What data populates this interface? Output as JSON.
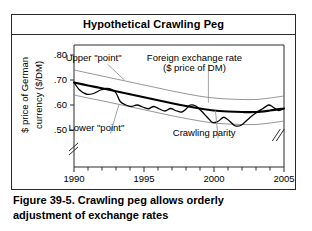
{
  "panel": {
    "title": "Hypothetical Crawling Peg"
  },
  "caption": {
    "line1": "Figure 39-5.  Crawling peg allows orderly",
    "line2": "adjustment of exchange rates"
  },
  "colors": {
    "frame": "#2a2a2a",
    "band": "#8a8a8a",
    "parity": "#000000",
    "rate": "#000000",
    "leader": "#8a8a8a"
  },
  "chart_data": {
    "type": "line",
    "title": "Hypothetical Crawling Peg",
    "xlabel": "Year",
    "ylabel": "$ price of German currency ($/DM)",
    "ylabel_line1": "$ price of German",
    "ylabel_line2": "currency ($/DM)",
    "xlim": [
      1990,
      2005
    ],
    "ylim": [
      0.44,
      0.84
    ],
    "grid": false,
    "axis_break_y": true,
    "axis_break_x": true,
    "xticks": [
      1990,
      1991,
      1992,
      1993,
      1994,
      1995,
      1996,
      1997,
      1998,
      1999,
      2000,
      2001,
      2002,
      2003,
      2004,
      2005
    ],
    "xtick_labels": [
      "1990",
      "",
      "",
      "",
      "",
      "1995",
      "",
      "",
      "",
      "",
      "2000",
      "",
      "",
      "",
      "",
      "2005"
    ],
    "yticks": [
      0.5,
      0.6,
      0.7,
      0.8
    ],
    "ytick_labels": [
      ".50",
      ".60",
      ".70",
      ".80"
    ],
    "legend_position": "none",
    "series": [
      {
        "name": "Upper \"point\"",
        "style": "thin-gray",
        "x": [
          1990,
          1991,
          1992,
          1993,
          1994,
          1995,
          1996,
          1997,
          1998,
          1999,
          2000,
          2001,
          2002,
          2003,
          2004,
          2005
        ],
        "values": [
          0.74,
          0.728,
          0.716,
          0.704,
          0.692,
          0.68,
          0.668,
          0.656,
          0.645,
          0.635,
          0.628,
          0.624,
          0.622,
          0.622,
          0.628,
          0.636
        ]
      },
      {
        "name": "Crawling parity",
        "style": "thick-black",
        "x": [
          1990,
          1991,
          1992,
          1993,
          1994,
          1995,
          1996,
          1997,
          1998,
          1999,
          2000,
          2001,
          2002,
          2003,
          2004,
          2005
        ],
        "values": [
          0.69,
          0.678,
          0.667,
          0.655,
          0.643,
          0.631,
          0.619,
          0.607,
          0.596,
          0.586,
          0.578,
          0.574,
          0.572,
          0.572,
          0.578,
          0.586
        ]
      },
      {
        "name": "Lower \"point\"",
        "style": "thin-gray",
        "x": [
          1990,
          1991,
          1992,
          1993,
          1994,
          1995,
          1996,
          1997,
          1998,
          1999,
          2000,
          2001,
          2002,
          2003,
          2004,
          2005
        ],
        "values": [
          0.64,
          0.628,
          0.617,
          0.605,
          0.593,
          0.581,
          0.569,
          0.557,
          0.546,
          0.536,
          0.528,
          0.524,
          0.522,
          0.522,
          0.528,
          0.536
        ]
      },
      {
        "name": "Foreign exchange rate ($ price of DM)",
        "style": "medium-black-wiggly",
        "x": [
          1990.0,
          1990.4,
          1990.9,
          1991.4,
          1991.9,
          1992.3,
          1992.7,
          1993.0,
          1993.3,
          1993.7,
          1994.1,
          1994.5,
          1994.9,
          1995.3,
          1995.7,
          1996.1,
          1996.5,
          1996.9,
          1997.3,
          1997.7,
          1998.0,
          1998.3,
          1998.7,
          1999.1,
          1999.5,
          1999.9,
          2000.3,
          2000.7,
          2001.1,
          2001.5,
          2001.9,
          2002.3,
          2002.7,
          2003.1,
          2003.5,
          2003.9,
          2004.2,
          2004.6,
          2005.0
        ],
        "values": [
          0.69,
          0.66,
          0.643,
          0.646,
          0.66,
          0.666,
          0.662,
          0.648,
          0.614,
          0.6,
          0.594,
          0.6,
          0.592,
          0.585,
          0.594,
          0.584,
          0.576,
          0.586,
          0.577,
          0.572,
          0.584,
          0.6,
          0.596,
          0.576,
          0.552,
          0.53,
          0.535,
          0.551,
          0.536,
          0.517,
          0.518,
          0.536,
          0.556,
          0.572,
          0.586,
          0.6,
          0.592,
          0.578,
          0.586
        ]
      }
    ],
    "annotations": [
      {
        "text": "Upper \"point\"",
        "x": 1991.4,
        "y": 0.775,
        "leader_to_x": 1993.6,
        "leader_to_y": 0.7
      },
      {
        "text": "Foreign exchange rate",
        "x": 1998.6,
        "y": 0.775,
        "leader_to_x": 1999.6,
        "leader_to_y": 0.61
      },
      {
        "text": "($ price of DM)",
        "x": 1998.6,
        "y": 0.735,
        "leader_to_x": null,
        "leader_to_y": null
      },
      {
        "text": "Lower \"point\"",
        "x": 1991.6,
        "y": 0.498,
        "leader_to_x": 1993.2,
        "leader_to_y": 0.6
      },
      {
        "text": "Crawling parity",
        "x": 1999.3,
        "y": 0.478,
        "leader_to_x": 2000.1,
        "leader_to_y": 0.578
      }
    ]
  }
}
